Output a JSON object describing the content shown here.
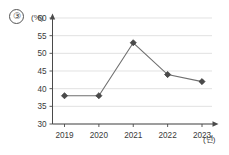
{
  "figure": {
    "number_label": "③",
    "y_unit_label": "(%)",
    "x_unit_label": "(년)"
  },
  "chart_data": {
    "type": "line",
    "title": "",
    "subtitle": "",
    "xlabel": "(년)",
    "ylabel": "(%)",
    "categories": [
      "2019",
      "2020",
      "2021",
      "2022",
      "2023"
    ],
    "values": [
      38,
      38,
      53,
      44,
      42
    ],
    "series": [
      {
        "name": "",
        "values": [
          38,
          38,
          53,
          44,
          42
        ]
      }
    ],
    "ylim": [
      30,
      60
    ],
    "yticks": [
      30,
      35,
      40,
      45,
      50,
      55,
      60
    ],
    "ytick_labels": [
      "30",
      "35",
      "40",
      "45",
      "50",
      "55",
      "60"
    ],
    "xtick_labels": [
      "2019",
      "2020",
      "2021",
      "2022",
      "2023"
    ],
    "grid": true,
    "grid_axis": "y",
    "legend": false,
    "legend_position": "none",
    "marker": "diamond",
    "colors": {
      "line": "#6f6f6f",
      "marker": "#4a4a4a",
      "grid": "#d6d6d6",
      "axis": "#4a4a4a",
      "text": "#3a3a3a",
      "background": "#ffffff"
    },
    "annotations": []
  }
}
